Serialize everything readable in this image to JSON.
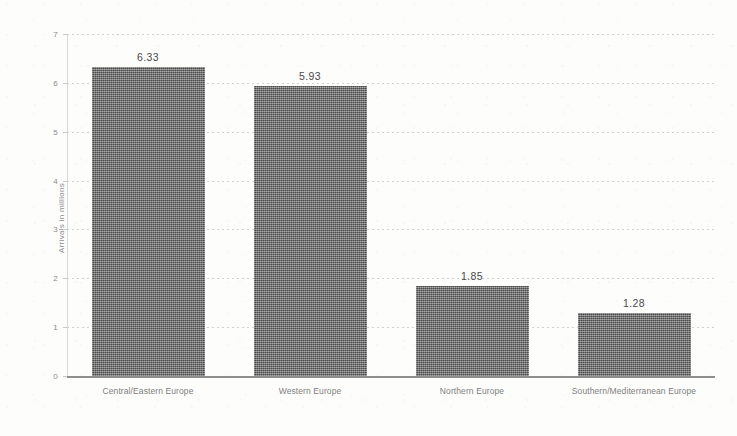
{
  "chart_data": {
    "type": "bar",
    "title": "",
    "xlabel": "",
    "ylabel": "Arrivals in millions",
    "categories": [
      "Central/Eastern Europe",
      "Western Europe",
      "Northern Europe",
      "Southern/Mediterranean Europe"
    ],
    "values": [
      6.33,
      5.93,
      1.85,
      1.28
    ],
    "value_labels": [
      "6.33",
      "5.93",
      "1.85",
      "1.28"
    ],
    "ylim": [
      0,
      7
    ],
    "yticks": [
      0,
      1,
      2,
      3,
      4,
      5,
      6,
      7
    ],
    "ytick_labels": [
      "0",
      "1",
      "2",
      "3",
      "4",
      "5",
      "6",
      "7"
    ],
    "grid": true,
    "legend": "none",
    "bar_color": "#5d5d5d",
    "gridline_color": "#d2d2d2",
    "axis_color": "#8e8e8e",
    "text_color": "#7d7d7d",
    "background_color": "#fdfdfc"
  }
}
